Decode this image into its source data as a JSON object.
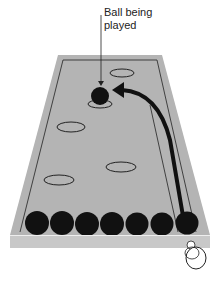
{
  "label": {
    "line1": "Ball being",
    "line2": "played"
  },
  "colors": {
    "board": "#b4b4b4",
    "rim": "#c8c8c8",
    "ball": "#111111",
    "line": "#222222",
    "hole_fill": "#b4b4b4"
  },
  "board": {
    "holes": [
      {
        "cx": 122,
        "cy": 73,
        "rx": 12,
        "ry": 4
      },
      {
        "cx": 100,
        "cy": 104,
        "rx": 12,
        "ry": 4
      },
      {
        "cx": 71,
        "cy": 127,
        "rx": 14,
        "ry": 5
      },
      {
        "cx": 121,
        "cy": 167,
        "rx": 15,
        "ry": 5
      },
      {
        "cx": 59,
        "cy": 180,
        "rx": 15,
        "ry": 5
      }
    ],
    "played_ball": {
      "cx": 100,
      "cy": 96,
      "r": 9
    },
    "row_balls": [
      37,
      62,
      87,
      112,
      137,
      162,
      187
    ]
  }
}
